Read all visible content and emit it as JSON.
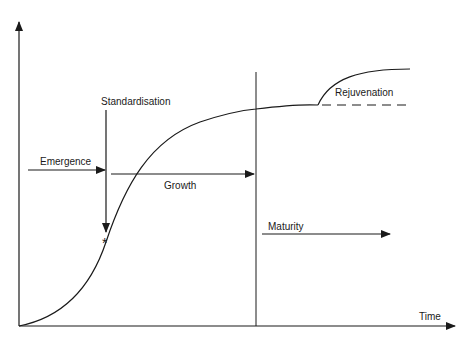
{
  "diagram": {
    "type": "lifecycle-s-curve",
    "axes": {
      "x_label": "Time",
      "y_label": ""
    },
    "phases": [
      {
        "id": "emergence",
        "label": "Emergence"
      },
      {
        "id": "growth",
        "label": "Growth"
      },
      {
        "id": "maturity",
        "label": "Maturity"
      }
    ],
    "annotations": {
      "standardisation": "Standardisation",
      "standardisation_marker": "*",
      "rejuvenation": "Rejuvenation"
    },
    "colors": {
      "line": "#1a1a1a",
      "background": "#ffffff"
    }
  }
}
